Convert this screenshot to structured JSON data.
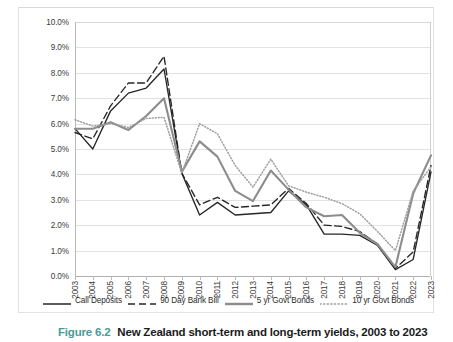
{
  "figure": {
    "caption_number": "Figure 6.2",
    "caption_text": "New Zealand short-term and long-term yields, 2003 to 2023"
  },
  "chart_data": {
    "type": "line",
    "title": "",
    "xlabel": "",
    "ylabel": "",
    "ylim": [
      0,
      10
    ],
    "ytick_labels": [
      "0.0%",
      "1.0%",
      "2.0%",
      "3.0%",
      "4.0%",
      "5.0%",
      "6.0%",
      "7.0%",
      "8.0%",
      "9.0%",
      "10.0%"
    ],
    "ytick_values": [
      0,
      1,
      2,
      3,
      4,
      5,
      6,
      7,
      8,
      9,
      10
    ],
    "grid": true,
    "legend_position": "bottom",
    "categories": [
      "2003",
      "2004",
      "2005",
      "2006",
      "2007",
      "2008",
      "2009",
      "2010",
      "2011",
      "2012",
      "2013",
      "2014",
      "2015",
      "2016",
      "2017",
      "2018",
      "2019",
      "2020",
      "2021",
      "2022",
      "2023"
    ],
    "x": [
      2003,
      2004,
      2005,
      2006,
      2007,
      2008,
      2009,
      2010,
      2011,
      2012,
      2013,
      2014,
      2015,
      2016,
      2017,
      2018,
      2019,
      2020,
      2021,
      2022,
      2023
    ],
    "series": [
      {
        "name": "Call Deposits",
        "style": "solid",
        "color": "#262626",
        "values": [
          5.8,
          5.0,
          6.5,
          7.2,
          7.4,
          8.15,
          4.05,
          2.4,
          2.9,
          2.4,
          2.45,
          2.5,
          3.35,
          2.8,
          1.65,
          1.65,
          1.6,
          1.2,
          0.25,
          0.65,
          4.1
        ]
      },
      {
        "name": "90 Day Bank Bill",
        "style": "dashed",
        "color": "#262626",
        "values": [
          5.65,
          5.4,
          6.7,
          7.6,
          7.6,
          8.65,
          4.05,
          2.8,
          3.1,
          2.7,
          2.75,
          2.8,
          3.45,
          2.85,
          2.0,
          1.95,
          1.75,
          1.25,
          0.3,
          0.95,
          4.35
        ]
      },
      {
        "name": "5 yr Govt Bonds",
        "style": "solid",
        "color": "#8c8c8c",
        "values": [
          5.8,
          5.8,
          6.05,
          5.75,
          6.3,
          7.0,
          4.1,
          5.3,
          4.7,
          3.35,
          2.95,
          4.15,
          3.4,
          2.7,
          2.35,
          2.4,
          1.7,
          1.25,
          0.35,
          3.25,
          4.75
        ]
      },
      {
        "name": "10 yr Govt Bonds",
        "style": "dotted",
        "color": "#9e9e9e",
        "values": [
          6.15,
          5.9,
          6.0,
          5.85,
          6.2,
          6.25,
          4.05,
          6.0,
          5.6,
          4.35,
          3.5,
          4.6,
          3.55,
          3.3,
          3.1,
          2.85,
          2.45,
          1.75,
          1.0,
          3.35,
          4.3
        ]
      }
    ]
  },
  "legend": {
    "items": [
      {
        "label": "Call Deposits",
        "swatch": "line-solid-black"
      },
      {
        "label": "90 Day Bank Bill",
        "swatch": "line-dashed-black"
      },
      {
        "label": "5 yr Govt Bonds",
        "swatch": "line-solid-gray"
      },
      {
        "label": "10 yr Govt Bonds",
        "swatch": "line-dotted-gray"
      }
    ]
  },
  "colors": {
    "accent": "#4a9b96",
    "grid": "#e2e2e2",
    "axis": "#b8b8b8",
    "text": "#3a3a3a"
  }
}
